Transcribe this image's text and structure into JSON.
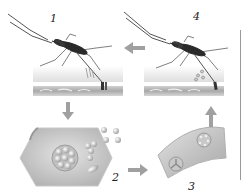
{
  "diagram": {
    "title": "",
    "steps": [
      {
        "id": "step-1",
        "label": "1",
        "description": "mosquito feeding on skin, injecting into blood vessel"
      },
      {
        "id": "step-2",
        "label": "2",
        "description": "hexagonal liver cell with parasite cluster releasing particles"
      },
      {
        "id": "step-3",
        "label": "3",
        "description": "curved red blood cell segment with parasite stages"
      },
      {
        "id": "step-4",
        "label": "4",
        "description": "mosquito taking up parasites from blood vessel"
      }
    ],
    "arrows": [
      {
        "from": "step-4",
        "to": "step-1",
        "direction": "left"
      },
      {
        "from": "step-1",
        "to": "step-2",
        "direction": "down"
      },
      {
        "from": "step-2",
        "to": "step-3",
        "direction": "right"
      },
      {
        "from": "step-3",
        "to": "step-4",
        "direction": "up"
      }
    ],
    "colors": {
      "cell_fill": "#d4d4d4",
      "cell_shadow": "#a8a8a8",
      "arrow": "#9e9e9e",
      "skin": "#e6e6e6",
      "vessel": "#b8b8b8",
      "mosquito": "#2a2a2a",
      "divider": "#9a9a9a"
    }
  }
}
